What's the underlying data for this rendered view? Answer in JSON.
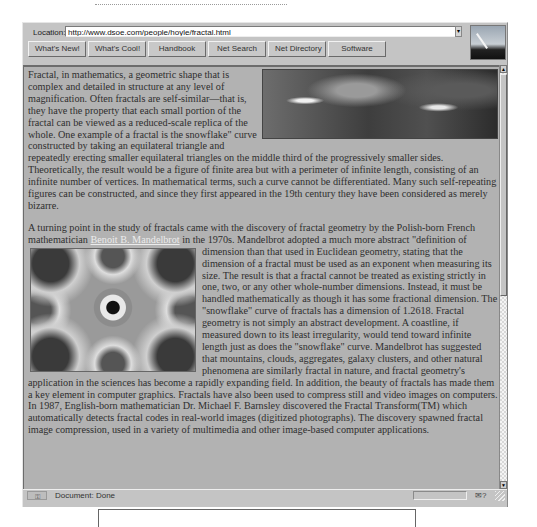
{
  "browser": {
    "location_label": "Location:",
    "url": "http://www.dsoe.com/people/hoyle/fractal.html",
    "dropdown_glyph": "▾",
    "directory_buttons": [
      {
        "label": "What's New!"
      },
      {
        "label": "What's Cool!"
      },
      {
        "label": "Handbook"
      },
      {
        "label": "Net Search"
      },
      {
        "label": "Net Directory"
      },
      {
        "label": "Software"
      }
    ],
    "throbber_icon": "netscape-logo-icon"
  },
  "article": {
    "paragraph1": "Fractal, in mathematics, a geometric shape that is complex and detailed in structure at any level of magnification. Often fractals are self-similar—that is, they have the property that each small portion of the fractal can be viewed as a reduced-scale replica of the whole. One example of a fractal is the snowflake\" curve constructed by taking an equilateral triangle and repeatedly erecting smaller equilateral triangles on the middle third of the progressively smaller sides. Theoretically, the result would be a figure of finite area but with a perimeter of infinite length, consisting of an infinite number of vertices. In mathematical terms, such a curve cannot be differentiated. Many such self-repeating figures can be constructed, and since they first appeared in the 19th century they have been considered as merely bizarre.",
    "paragraph2_before_link": "A turning point in the study of fractals came with the discovery of fractal geometry by the Polish-born French mathematician ",
    "link_text": "Benoit B. Mandelbrot",
    "paragraph2_after_link": " in the 1970s. Mandelbrot adopted a much more abstract \"definition of dimension than that used in Euclidean geometry, stating that the dimension of a fractal must be used as an exponent when measuring its size. The result is that a fractal cannot be treated as existing strictly in one, two, or any other whole-number dimensions. Instead, it must be handled mathematically as though it has some fractional dimension. The \"snowflake\" curve of fractals has a dimension of 1.2618. Fractal geometry is not simply an abstract development. A coastline, if measured down to its least irregularity, would tend toward infinite length just as does the \"snowflake\" curve. Mandelbrot has suggested that mountains, clouds, aggregates, galaxy clusters, and other natural phenomena are similarly fractal in nature, and fractal geometry's application in the sciences has become a rapidly expanding field. In addition, the beauty of fractals has made them a key element in computer graphics. Fractals have also been used to compress still and video images on computers. In 1987, English-born mathematician Dr. Michael F. Barnsley discovered the Fractal Transform(TM) which automatically detects fractal codes in real-world images (digitized photographs). The discovery spawned fractal image compression, used in a variety of multimedia and other image-based computer applications."
  },
  "scrollbar": {
    "up_glyph": "▲",
    "down_glyph": "▼"
  },
  "status": {
    "security_glyph": "⚿",
    "text": "Document: Done",
    "mail_glyph": "✉?"
  }
}
